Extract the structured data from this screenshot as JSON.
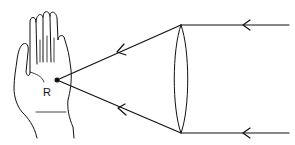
{
  "diagram": {
    "labels": {
      "hand": "R"
    },
    "elements": [
      "hand",
      "focus-point",
      "convex-lens",
      "incoming-parallel-rays",
      "converging-rays"
    ],
    "colors": {
      "stroke": "#111111",
      "background": "#ffffff"
    }
  }
}
